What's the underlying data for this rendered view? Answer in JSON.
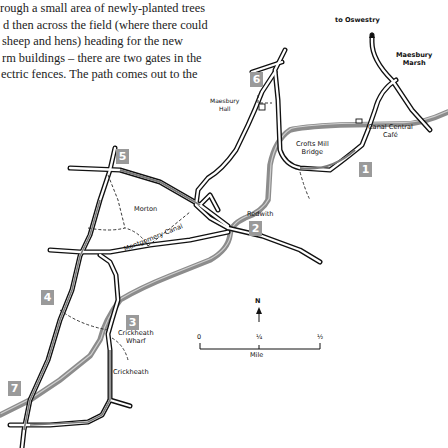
{
  "prose": {
    "lines": [
      "rough a small area of newly-planted trees",
      "d then across the field (where there could",
      " sheep and hens) heading for the new",
      "rm buildings – there are two gates in the",
      "ectric fences. The path comes out to the"
    ]
  },
  "map": {
    "places": {
      "to_oswestry": "to Oswestry",
      "maesbury_marsh": [
        "Maesbury",
        "Marsh"
      ],
      "maesbury_hall": [
        "Maesbury",
        "Hall"
      ],
      "canal_central_cafe": [
        "Canal Central",
        "Café"
      ],
      "crofts_mill_bridge": [
        "Crofts Mill",
        "Bridge"
      ],
      "morton": "Morton",
      "redwith": "Redwith",
      "montgomery_canal": "Montgomery Canal",
      "crickheath_wharf": [
        "Crickheath",
        "Wharf"
      ],
      "crickheath": "Crickheath"
    },
    "waypoints": [
      "1",
      "2",
      "3",
      "4",
      "5",
      "6",
      "7"
    ],
    "colors": {
      "canal": "#8c8c8c",
      "route": "#7a7a7a",
      "badge": "#9a9a9a",
      "road_outline": "#111111"
    },
    "north_label": "N",
    "scale": {
      "ticks": [
        "0",
        "¼",
        "½"
      ],
      "unit": "Mile"
    }
  }
}
